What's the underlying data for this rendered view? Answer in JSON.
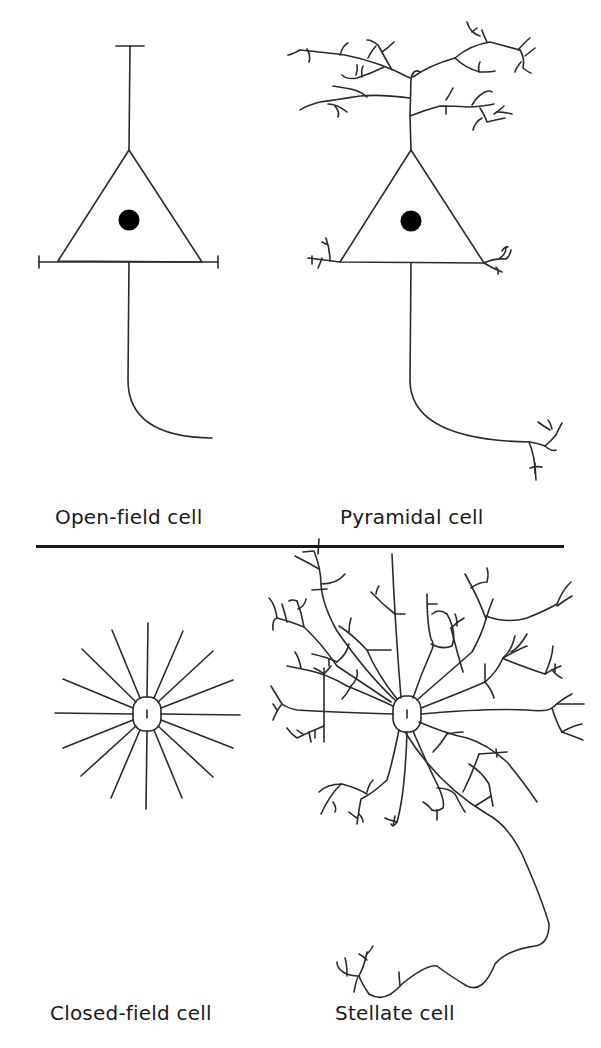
{
  "figure": {
    "panels": [
      {
        "id": "open-field",
        "label": "Open-field cell"
      },
      {
        "id": "pyramidal",
        "label": "Pyramidal cell"
      },
      {
        "id": "closed-field",
        "label": "Closed-field cell"
      },
      {
        "id": "stellate",
        "label": "Stellate cell"
      }
    ],
    "line_color": "#2a2a2a",
    "nucleus_color": "#000000",
    "background": "#ffffff"
  }
}
